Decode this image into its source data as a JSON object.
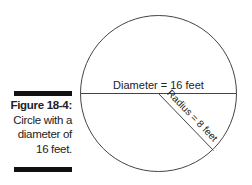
{
  "caption": {
    "label": "Figure 18-4:",
    "lines": [
      "Circle with a",
      "diameter of",
      "16 feet."
    ]
  },
  "diagram": {
    "shape": "circle",
    "diameter_label": "Diameter = 16 feet",
    "radius_label": "Radius = 8 feet",
    "stroke_color": "#444444"
  }
}
